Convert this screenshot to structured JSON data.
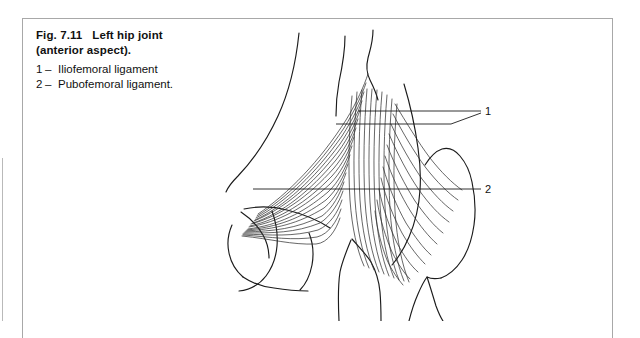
{
  "figure": {
    "number": "Fig. 7.11",
    "title": "Left hip joint",
    "subtitle": "(anterior aspect).",
    "legend": [
      {
        "num": "1",
        "dash": "–",
        "label": "Iliofemoral ligament"
      },
      {
        "num": "2",
        "dash": "–",
        "label": "Pubofemoral ligament."
      }
    ],
    "callouts": [
      {
        "id": "1",
        "text": "1"
      },
      {
        "id": "2",
        "text": "2"
      }
    ]
  },
  "colors": {
    "ink": "#111111",
    "line": "#1b1b1b",
    "fiber": "#2b2b2b",
    "border": "#a8a8a8",
    "rule": "#b9b9b9",
    "background": "#ffffff"
  },
  "illustration": {
    "name": "left-hip-joint-anterior-line-drawing",
    "structures": [
      "ilium",
      "iliac-crest",
      "pubis",
      "obturator-foramen",
      "femoral-head-neck",
      "greater-trochanter",
      "femoral-shaft",
      "iliofemoral-ligament-fibers",
      "pubofemoral-ligament-fibers"
    ]
  }
}
